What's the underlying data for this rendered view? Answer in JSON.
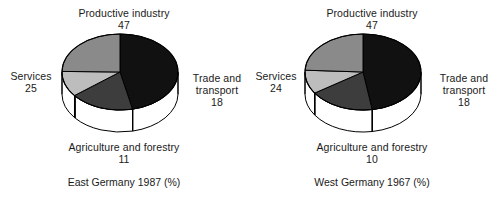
{
  "chart_data": [
    {
      "type": "pie",
      "title": "East Germany 1987 (%)",
      "categories": [
        "Productive industry",
        "Trade and transport",
        "Agriculture and forestry",
        "Services"
      ],
      "values": [
        47,
        18,
        11,
        25
      ],
      "labels": [
        "47",
        "18",
        "11",
        "25"
      ],
      "colors": [
        "#111111",
        "#3d3d3d",
        "#bdbdbd",
        "#8a8a8a"
      ],
      "legend": "none",
      "grid": false,
      "annotations": [
        {
          "name": "Productive industry",
          "value": 47,
          "position": "top"
        },
        {
          "name": "Trade and transport",
          "value": 18,
          "position": "right"
        },
        {
          "name": "Agriculture and forestry",
          "value": 11,
          "position": "bottom"
        },
        {
          "name": "Services",
          "value": 25,
          "position": "left"
        }
      ]
    },
    {
      "type": "pie",
      "title": "West Germany 1967 (%)",
      "categories": [
        "Productive industry",
        "Trade and transport",
        "Agriculture and forestry",
        "Services"
      ],
      "values": [
        47,
        18,
        10,
        24
      ],
      "labels": [
        "47",
        "18",
        "10",
        "24"
      ],
      "colors": [
        "#111111",
        "#3d3d3d",
        "#bdbdbd",
        "#8a8a8a"
      ],
      "legend": "none",
      "grid": false,
      "annotations": [
        {
          "name": "Productive industry",
          "value": 47,
          "position": "top"
        },
        {
          "name": "Trade and transport",
          "value": 18,
          "position": "right"
        },
        {
          "name": "Agriculture and forestry",
          "value": 10,
          "position": "bottom"
        },
        {
          "name": "Services",
          "value": 24,
          "position": "left"
        }
      ]
    }
  ],
  "charts": {
    "east": {
      "caption": "East Germany 1987 (%)",
      "top_label": "Productive industry",
      "top_value": "47",
      "right_label_line1": "Trade and",
      "right_label_line2": "transport",
      "right_value": "18",
      "bottom_label": "Agriculture and forestry",
      "bottom_value": "11",
      "left_label": "Services",
      "left_value": "25"
    },
    "west": {
      "caption": "West Germany 1967 (%)",
      "top_label": "Productive industry",
      "top_value": "47",
      "right_label_line1": "Trade and",
      "right_label_line2": "transport",
      "right_value": "18",
      "bottom_label": "Agriculture and forestry",
      "bottom_value": "10",
      "left_label": "Services",
      "left_value": "24"
    }
  },
  "colors": {
    "productive_industry": "#111111",
    "trade_and_transport": "#3d3d3d",
    "agriculture_and_forestry": "#bdbdbd",
    "services": "#8a8a8a",
    "background": "#ffffff",
    "outline": "#000000",
    "text": "#1a1a1a"
  }
}
